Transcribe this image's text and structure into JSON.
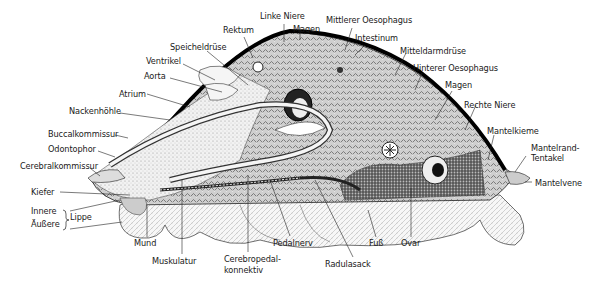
{
  "figure": {
    "labels": {
      "linke_niere": "Linke Niere",
      "magen_top": "Magen",
      "mittlerer_oesophagus": "Mittlerer Oesophagus",
      "rektum": "Rektum",
      "intestinum": "Intestinum",
      "speicheldruese": "Speicheldrüse",
      "mitteldarmdruese": "Mitteldarmdrüse",
      "ventrikel": "Ventrikel",
      "hinterer_oesophagus": "Hinterer Oesophagus",
      "aorta": "Aorta",
      "magen_right": "Magen",
      "atrium": "Atrium",
      "rechte_niere": "Rechte Niere",
      "nackenhoehle": "Nackenhöhle",
      "mantelkieme": "Mantelkieme",
      "buccalkommissur": "Buccalkommissur",
      "odontophor": "Odontophor",
      "mantelrand_1": "Mantelrand-",
      "mantelrand_2": "Tentakel",
      "cerebralkommissur": "Cerebralkommissur",
      "mantelvene": "Mantelvene",
      "kiefer": "Kiefer",
      "innere": "Innere",
      "aeussere": "Äußere",
      "lippe": "Lippe",
      "mund": "Mund",
      "muskulatur": "Muskulatur",
      "cerebropedal_1": "Cerebropedal-",
      "cerebropedal_2": "konnektiv",
      "pedalnerv": "Pedalnerv",
      "radulasack": "Radulasack",
      "fuss": "Fuß",
      "ovar": "Ovar"
    }
  }
}
